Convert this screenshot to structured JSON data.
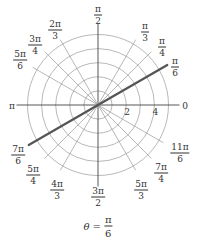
{
  "diagram": {
    "type": "polar-grid",
    "center": [
      98,
      105
    ],
    "unit_px": 14.1,
    "circles": [
      1,
      2,
      3,
      4,
      5
    ],
    "radius_labels": [
      {
        "text": "2",
        "r": 2
      },
      {
        "text": "4",
        "r": 4
      }
    ],
    "spoke_angles_deg": [
      0,
      30,
      45,
      60,
      90,
      120,
      135,
      150,
      180,
      210,
      225,
      240,
      270,
      300,
      315,
      330
    ],
    "highlight_ray": {
      "angle_deg": 30,
      "extent_px": 80,
      "color": "#555555"
    },
    "angle_labels": [
      {
        "id": "0",
        "num": "0",
        "den": "",
        "x": 185,
        "y": 106
      },
      {
        "id": "pi-6",
        "num": "π",
        "den": "6",
        "x": 175,
        "y": 67
      },
      {
        "id": "pi-4",
        "num": "π",
        "den": "4",
        "x": 162,
        "y": 47
      },
      {
        "id": "pi-3",
        "num": "π",
        "den": "3",
        "x": 145,
        "y": 32
      },
      {
        "id": "pi-2",
        "num": "π",
        "den": "2",
        "x": 98,
        "y": 15
      },
      {
        "id": "2pi-3",
        "num": "2π",
        "den": "3",
        "x": 55,
        "y": 30
      },
      {
        "id": "3pi-4",
        "num": "3π",
        "den": "4",
        "x": 35,
        "y": 45
      },
      {
        "id": "5pi-6",
        "num": "5π",
        "den": "6",
        "x": 20,
        "y": 60
      },
      {
        "id": "pi",
        "num": "π",
        "den": "",
        "x": 12,
        "y": 106
      },
      {
        "id": "7pi-6",
        "num": "7π",
        "den": "6",
        "x": 18,
        "y": 155
      },
      {
        "id": "5pi-4",
        "num": "5π",
        "den": "4",
        "x": 33,
        "y": 175
      },
      {
        "id": "4pi-3",
        "num": "4π",
        "den": "3",
        "x": 57,
        "y": 190
      },
      {
        "id": "3pi-2",
        "num": "3π",
        "den": "2",
        "x": 98,
        "y": 197
      },
      {
        "id": "5pi-3",
        "num": "5π",
        "den": "3",
        "x": 141,
        "y": 190
      },
      {
        "id": "7pi-4",
        "num": "7π",
        "den": "4",
        "x": 161,
        "y": 173
      },
      {
        "id": "11pi-6",
        "num": "11π",
        "den": "6",
        "x": 180,
        "y": 153
      }
    ],
    "caption": {
      "lhs": "θ =",
      "num": "π",
      "den": "6"
    }
  }
}
